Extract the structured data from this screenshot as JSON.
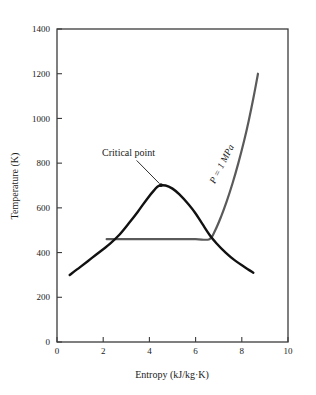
{
  "chart_data": {
    "type": "line",
    "title": "",
    "xlabel": "Entropy (kJ/kg·K)",
    "ylabel": "Temperature (K)",
    "xlim": [
      0,
      10
    ],
    "ylim": [
      0,
      1400
    ],
    "xticks": [
      "0",
      "2",
      "4",
      "6",
      "8",
      "10"
    ],
    "xtick_values": [
      0,
      2,
      4,
      6,
      8,
      10
    ],
    "yticks": [
      "0",
      "200",
      "400",
      "600",
      "800",
      "1000",
      "1200",
      "1400"
    ],
    "ytick_values": [
      0,
      200,
      400,
      600,
      800,
      1000,
      1200,
      1400
    ],
    "grid": false,
    "legend_position": "none",
    "series": [
      {
        "name": "saturation-dome",
        "color": "#111111",
        "linewidth": 2.4,
        "points": [
          [
            0.55,
            300
          ],
          [
            1.0,
            335
          ],
          [
            1.5,
            375
          ],
          [
            2.0,
            415
          ],
          [
            2.3,
            440
          ],
          [
            2.7,
            480
          ],
          [
            3.1,
            530
          ],
          [
            3.5,
            583
          ],
          [
            3.9,
            640
          ],
          [
            4.2,
            678
          ],
          [
            4.4,
            698
          ],
          [
            4.7,
            700
          ],
          [
            5.0,
            686
          ],
          [
            5.3,
            660
          ],
          [
            5.7,
            615
          ],
          [
            6.0,
            575
          ],
          [
            6.3,
            527
          ],
          [
            6.6,
            480
          ],
          [
            6.9,
            442
          ],
          [
            7.3,
            400
          ],
          [
            7.7,
            365
          ],
          [
            8.1,
            337
          ],
          [
            8.5,
            310
          ]
        ]
      },
      {
        "name": "isobar-1-MPa",
        "color": "#5a5a5a",
        "linewidth": 2.2,
        "points": [
          [
            2.15,
            460
          ],
          [
            3.0,
            460
          ],
          [
            4.0,
            460
          ],
          [
            5.0,
            460
          ],
          [
            6.0,
            460
          ],
          [
            6.6,
            460
          ],
          [
            6.85,
            500
          ],
          [
            7.1,
            560
          ],
          [
            7.35,
            630
          ],
          [
            7.6,
            710
          ],
          [
            7.85,
            800
          ],
          [
            8.1,
            900
          ],
          [
            8.3,
            990
          ],
          [
            8.5,
            1090
          ],
          [
            8.7,
            1200
          ]
        ]
      }
    ],
    "annotations": [
      {
        "name": "critical-point",
        "label": "Critical point",
        "text_x": 3.1,
        "text_y": 830,
        "point_x": 4.5,
        "point_y": 702,
        "marker": true
      },
      {
        "name": "isobar-pressure",
        "label": "P = 1 MPa",
        "text_x": 7.25,
        "text_y": 790,
        "rotation": -63
      }
    ]
  },
  "axes": {
    "x_title": "Entropy (kJ/kg·K)",
    "y_title": "Temperature (K)",
    "x_labels": [
      "0",
      "2",
      "4",
      "6",
      "8",
      "10"
    ],
    "y_labels": [
      "0",
      "200",
      "400",
      "600",
      "800",
      "1000",
      "1200",
      "1400"
    ]
  },
  "annotation_text": {
    "critical_point": "Critical point",
    "isobar": "P = 1 MPa"
  },
  "colors": {
    "dome": "#111111",
    "isobar": "#5a5a5a",
    "frame": "#3b3b3b",
    "text": "#1a1a1a",
    "background": "#ffffff"
  }
}
